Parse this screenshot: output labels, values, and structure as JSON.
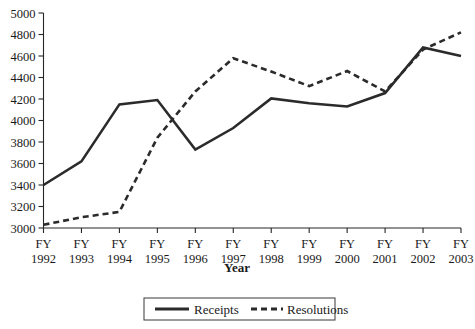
{
  "chart_data": {
    "type": "line",
    "title": "",
    "xlabel": "Year",
    "ylabel": "",
    "categories": [
      "FY\n1992",
      "FY\n1993",
      "FY\n1994",
      "FY\n1995",
      "FY\n1996",
      "FY\n1997",
      "FY\n1998",
      "FY\n1999",
      "FY\n2000",
      "FY\n2001",
      "FY\n2002",
      "FY\n2003"
    ],
    "x_tick_prefix": "FY",
    "x_tick_years": [
      "1992",
      "1993",
      "1994",
      "1995",
      "1996",
      "1997",
      "1998",
      "1999",
      "2000",
      "2001",
      "2002",
      "2003"
    ],
    "ylim": [
      3000,
      5000
    ],
    "y_ticks": [
      3000,
      3200,
      3400,
      3600,
      3800,
      4000,
      4200,
      4400,
      4600,
      4800,
      5000
    ],
    "grid": false,
    "legend_position": "bottom",
    "series": [
      {
        "name": "Receipts",
        "style": "solid",
        "color": "#2b2b2b",
        "values": [
          3400,
          3620,
          4150,
          4190,
          3730,
          3930,
          4205,
          4160,
          4130,
          4255,
          4680,
          4600
        ]
      },
      {
        "name": "Resolutions",
        "style": "dashed",
        "color": "#2b2b2b",
        "values": [
          3030,
          3100,
          3150,
          3840,
          4270,
          4580,
          4455,
          4320,
          4460,
          4270,
          4660,
          4820
        ]
      }
    ]
  },
  "axis": {
    "y_tick_labels": [
      "3000",
      "3200",
      "3400",
      "3600",
      "3800",
      "4000",
      "4200",
      "4400",
      "4600",
      "4800",
      "5000"
    ],
    "x_title": "Year"
  },
  "legend": {
    "items": [
      {
        "label": "Receipts",
        "style": "solid"
      },
      {
        "label": "Resolutions",
        "style": "dashed"
      }
    ]
  }
}
